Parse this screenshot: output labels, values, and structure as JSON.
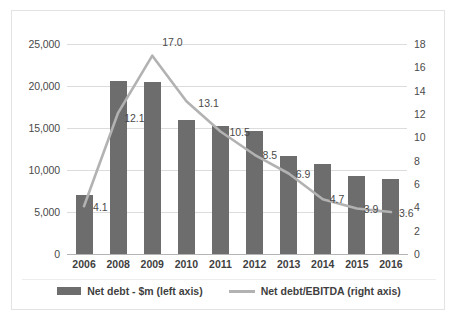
{
  "chart_data": {
    "type": "bar",
    "title": "",
    "subtitle": "",
    "xlabel": "",
    "ylabel": "",
    "categories": [
      "2006",
      "2008",
      "2009",
      "2010",
      "2011",
      "2012",
      "2013",
      "2014",
      "2015",
      "2016"
    ],
    "grid": true,
    "legend_position": "bottom",
    "axes": {
      "left": {
        "label": "Net debt - $m",
        "min": 0,
        "max": 25000,
        "step": 5000,
        "ticks": [
          "0",
          "5,000",
          "10,000",
          "15,000",
          "20,000",
          "25,000"
        ],
        "tick_values": [
          0,
          5000,
          10000,
          15000,
          20000,
          25000
        ]
      },
      "right": {
        "label": "Net debt/EBITDA",
        "min": 0,
        "max": 18,
        "step": 2,
        "ticks": [
          "0",
          "2",
          "4",
          "6",
          "8",
          "10",
          "12",
          "14",
          "16",
          "18"
        ],
        "tick_values": [
          0,
          2,
          4,
          6,
          8,
          10,
          12,
          14,
          16,
          18
        ]
      }
    },
    "series": [
      {
        "name": "Net debt - $m (left axis)",
        "type": "bar",
        "axis": "left",
        "color": "#6d6d6d",
        "values": [
          7000,
          20600,
          20500,
          16000,
          15200,
          14600,
          11700,
          10700,
          9300,
          8900
        ],
        "data_labels": false
      },
      {
        "name": "Net debt/EBITDA (right axis)",
        "type": "line",
        "axis": "right",
        "color": "#b2b2b2",
        "values": [
          4.1,
          12.1,
          17.0,
          13.1,
          10.5,
          8.5,
          6.9,
          4.7,
          3.9,
          3.6
        ],
        "data_labels": true,
        "data_label_text": [
          "4.1",
          "12.1",
          "17.0",
          "13.1",
          "10.5",
          "8.5",
          "6.9",
          "4.7",
          "3.9",
          "3.6"
        ]
      }
    ]
  },
  "legend": {
    "items": [
      {
        "label": "Net debt - $m (left axis)",
        "marker": "bar-swatch-icon",
        "color": "#6d6d6d"
      },
      {
        "label": "Net debt/EBITDA (right axis)",
        "marker": "line-swatch-icon",
        "color": "#b2b2b2"
      }
    ]
  }
}
